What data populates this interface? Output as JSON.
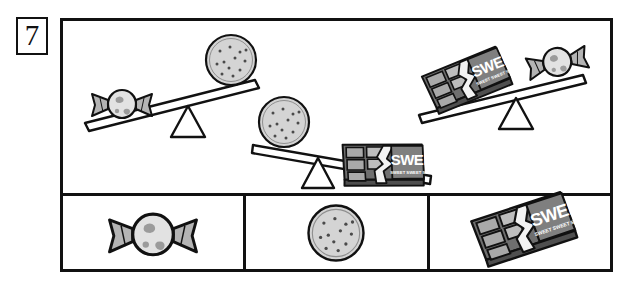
{
  "question": {
    "number": "7",
    "number_label": "7"
  },
  "colors": {
    "ink": "#111111",
    "paper": "#ffffff",
    "item_fill_light": "#d9d9d9",
    "item_fill_mid": "#b3b3b3",
    "item_fill_dark": "#8c8c8c",
    "item_fill_darker": "#6e6e6e",
    "wrapper_band": "#7a7a7a"
  },
  "scales": [
    {
      "id": "scale-1",
      "name": "balance-candy-vs-cookie",
      "left_item": "candy",
      "left_item_label": "Candy",
      "right_item": "cookie",
      "right_item_label": "Cookie",
      "tilt": "left-down",
      "heavier_item": "candy",
      "reading": "Candy is heavier than cookie"
    },
    {
      "id": "scale-2",
      "name": "balance-cookie-vs-chocolate",
      "left_item": "cookie",
      "left_item_label": "Cookie",
      "right_item": "chocolate",
      "right_item_label": "Chocolate bar",
      "tilt": "right-down",
      "heavier_item": "chocolate",
      "reading": "Chocolate bar is heavier than cookie"
    },
    {
      "id": "scale-3",
      "name": "balance-chocolate-vs-candy",
      "left_item": "chocolate",
      "left_item_label": "Chocolate bar",
      "right_item": "candy",
      "right_item_label": "Candy",
      "tilt": "left-down",
      "heavier_item": "chocolate",
      "reading": "Chocolate bar is heavier than candy"
    }
  ],
  "answer_boxes": [
    {
      "id": "answer-box-1",
      "item": "candy",
      "item_label": "Candy",
      "value": ""
    },
    {
      "id": "answer-box-2",
      "item": "cookie",
      "item_label": "Cookie",
      "value": ""
    },
    {
      "id": "answer-box-3",
      "item": "chocolate",
      "item_label": "Chocolate bar",
      "value": ""
    }
  ],
  "chocolate_wrapper": {
    "brand_text": "SWEET",
    "tagline_text": "SWEET SWEET SWEET SWEET"
  }
}
